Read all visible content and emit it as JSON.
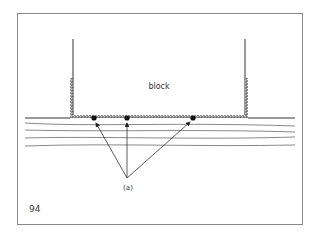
{
  "figure": {
    "block_label": "block",
    "pointer_label": "(a)",
    "figure_number": "94"
  }
}
